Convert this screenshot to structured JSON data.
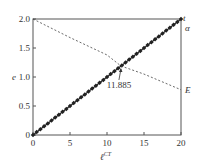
{
  "chart_data": {
    "type": "line",
    "title": "",
    "xlabel": "ℓ",
    "xlabel_sup": "CT",
    "ylabel": "e",
    "xlim": [
      0,
      20
    ],
    "ylim": [
      0,
      2.0
    ],
    "x_ticks": [
      "0",
      "5",
      "10",
      "15",
      "20"
    ],
    "y_ticks": [
      "0",
      "0.5",
      "1.0",
      "1.5",
      "2.0"
    ],
    "grid": false,
    "series": [
      {
        "name": "t",
        "style": "solid-with-markers",
        "x": [
          0,
          20
        ],
        "values": [
          0,
          2.0
        ],
        "marker_spacing": 0.5
      },
      {
        "name": "α",
        "style": "solid",
        "x": [
          0,
          20
        ],
        "values": [
          0,
          2.0
        ]
      },
      {
        "name": "E",
        "style": "dashed",
        "x": [
          0,
          5,
          10,
          11.885,
          15,
          20
        ],
        "values": [
          2.0,
          1.68,
          1.38,
          1.19,
          1.05,
          0.78
        ]
      }
    ],
    "annotations": [
      {
        "text": "11.885",
        "x": 11.885,
        "y": 1.19,
        "arrow": true
      }
    ],
    "right_labels": [
      "t",
      "α",
      "E"
    ]
  }
}
